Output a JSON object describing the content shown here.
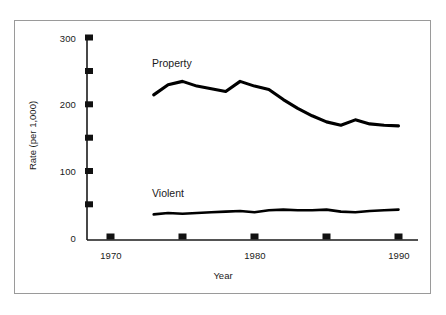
{
  "chart_data": {
    "type": "line",
    "title": "",
    "xlabel": "Year",
    "ylabel": "Rate (per 1,000)",
    "xlim": [
      1969,
      1991
    ],
    "ylim": [
      0,
      300
    ],
    "grid": false,
    "legend_position": "inline-labels",
    "x_ticks": [
      1970,
      1975,
      1980,
      1985,
      1990
    ],
    "x_tick_labels": [
      "1970",
      "",
      "1980",
      "",
      "1990"
    ],
    "y_ticks": [
      0,
      50,
      100,
      150,
      200,
      250,
      300
    ],
    "y_tick_labels": [
      "0",
      "",
      "100",
      "",
      "200",
      "",
      "300"
    ],
    "x": [
      1973,
      1974,
      1975,
      1976,
      1977,
      1978,
      1979,
      1980,
      1981,
      1982,
      1983,
      1984,
      1985,
      1986,
      1987,
      1988,
      1989,
      1990
    ],
    "series": [
      {
        "name": "Property",
        "label": "Property",
        "color": "#000000",
        "values": [
          215,
          230,
          235,
          228,
          224,
          220,
          235,
          228,
          223,
          208,
          195,
          184,
          175,
          170,
          178,
          172,
          170,
          169
        ]
      },
      {
        "name": "Violent",
        "label": "Violent",
        "color": "#000000",
        "values": [
          38,
          40,
          39,
          40,
          41,
          42,
          43,
          41,
          44,
          45,
          44,
          44,
          45,
          42,
          41,
          43,
          44,
          45
        ]
      }
    ],
    "annotations": [
      {
        "text": "Property",
        "x": 1976,
        "y": 268
      },
      {
        "text": "Violent",
        "x": 1976,
        "y": 78
      }
    ]
  },
  "axis": {
    "y_title": "Rate (per 1,000)",
    "x_title": "Year"
  },
  "labels": {
    "property": "Property",
    "violent": "Violent"
  },
  "y_tick_text": {
    "t0": "0",
    "t100": "100",
    "t200": "200",
    "t300": "300"
  },
  "x_tick_text": {
    "t1970": "1970",
    "t1980": "1980",
    "t1990": "1990"
  },
  "caption": ""
}
